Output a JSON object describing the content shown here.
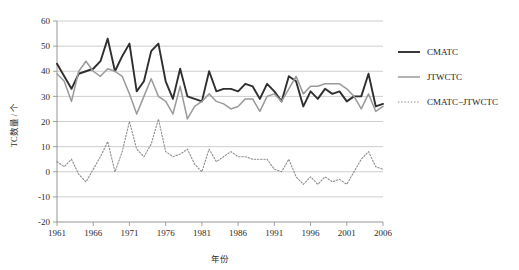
{
  "chart_data": {
    "type": "line",
    "title": "",
    "xlabel": "年份",
    "ylabel": "TC数量 / 个",
    "xlim": [
      1961,
      2006
    ],
    "ylim": [
      -20,
      60
    ],
    "ytick_values": [
      60,
      50,
      40,
      30,
      20,
      10,
      0,
      -10,
      -20
    ],
    "ytick_labels": [
      "60",
      "50",
      "40",
      "30",
      "20",
      "10",
      "0",
      "-10",
      "-20"
    ],
    "xtick_values": [
      1961,
      1966,
      1971,
      1976,
      1981,
      1986,
      1991,
      1996,
      2001,
      2006
    ],
    "xtick_labels": [
      "1961",
      "1966",
      "1971",
      "1976",
      "1981",
      "1986",
      "1991",
      "1996",
      "2001",
      "2006"
    ],
    "grid": "horizontal",
    "legend_position": "right",
    "x": [
      1961,
      1962,
      1963,
      1964,
      1965,
      1966,
      1967,
      1968,
      1969,
      1970,
      1971,
      1972,
      1973,
      1974,
      1975,
      1976,
      1977,
      1978,
      1979,
      1980,
      1981,
      1982,
      1983,
      1984,
      1985,
      1986,
      1987,
      1988,
      1989,
      1990,
      1991,
      1992,
      1993,
      1994,
      1995,
      1996,
      1997,
      1998,
      1999,
      2000,
      2001,
      2002,
      2003,
      2004,
      2005,
      2006
    ],
    "series": [
      {
        "name": "CMATC",
        "color": "#2f2f2f",
        "width": 1.9,
        "dash": "none",
        "values": [
          43,
          38,
          33,
          39,
          40,
          41,
          44,
          53,
          40,
          46,
          51,
          32,
          36,
          48,
          51,
          36,
          29,
          41,
          30,
          29,
          28,
          40,
          32,
          33,
          33,
          32,
          35,
          34,
          29,
          35,
          32,
          28,
          38,
          36,
          26,
          32,
          29,
          33,
          31,
          32,
          28,
          30,
          30,
          39,
          26,
          27
        ]
      },
      {
        "name": "JTWCTC",
        "color": "#9a9a9a",
        "width": 1.5,
        "dash": "none",
        "values": [
          39,
          36,
          28,
          40,
          44,
          40,
          38,
          41,
          40,
          38,
          31,
          23,
          30,
          37,
          30,
          28,
          23,
          34,
          21,
          26,
          28,
          31,
          28,
          27,
          25,
          26,
          29,
          29,
          24,
          30,
          31,
          28,
          33,
          38,
          31,
          34,
          34,
          35,
          35,
          35,
          33,
          30,
          25,
          31,
          24,
          26
        ]
      },
      {
        "name": "CMATC−JTWCTC",
        "color": "#8c8c8c",
        "width": 1.1,
        "dash": "1.4 1.8",
        "values": [
          4,
          2,
          5,
          -1,
          -4,
          1,
          6,
          12,
          0,
          8,
          20,
          9,
          6,
          11,
          21,
          8,
          6,
          7,
          9,
          3,
          0,
          9,
          4,
          6,
          8,
          6,
          6,
          5,
          5,
          5,
          1,
          0,
          5,
          -2,
          -5,
          -2,
          -5,
          -2,
          -4,
          -3,
          -5,
          0,
          5,
          8,
          2,
          1
        ]
      }
    ]
  },
  "legend": {
    "items": [
      {
        "label": "CMATC"
      },
      {
        "label": "JTWCTC"
      },
      {
        "label": "CMATC−JTWCTC"
      }
    ]
  }
}
